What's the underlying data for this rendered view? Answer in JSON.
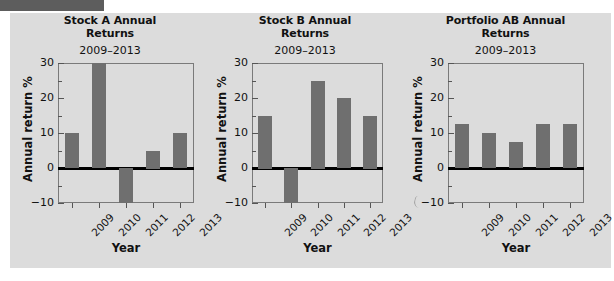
{
  "header": {
    "strip_color": "#5d5d5d"
  },
  "panel": {
    "background": "#dcdcdc",
    "bar_color": "#6f6f6f",
    "axis_color": "#7a7a7a"
  },
  "common": {
    "subtitle": "2009–2013",
    "xlabel": "Year",
    "ylabel": "Annual return %",
    "ytick_labels": [
      "30",
      "20",
      "10",
      "0",
      "−10"
    ],
    "ytick_values": [
      30,
      20,
      10,
      0,
      -10
    ],
    "categories": [
      "2009",
      "2010",
      "2011",
      "2012",
      "2013"
    ]
  },
  "charts": [
    {
      "title_line1": "Stock A Annual",
      "title_line2": "Returns"
    },
    {
      "title_line1": "Stock B Annual",
      "title_line2": "Returns"
    },
    {
      "title_line1": "Portfolio AB Annual",
      "title_line2": "Returns"
    }
  ],
  "chart_data": [
    {
      "type": "bar",
      "title": "Stock A Annual Returns",
      "subtitle": "2009–2013",
      "xlabel": "Year",
      "ylabel": "Annual return %",
      "categories": [
        "2009",
        "2010",
        "2011",
        "2012",
        "2013"
      ],
      "values": [
        10,
        30,
        -10,
        5,
        10
      ],
      "ylim": [
        -10,
        30
      ],
      "ytick_labels": [
        "30",
        "20",
        "10",
        "0",
        "−10"
      ],
      "grid": false,
      "legend": "none"
    },
    {
      "type": "bar",
      "title": "Stock B Annual Returns",
      "subtitle": "2009–2013",
      "xlabel": "Year",
      "ylabel": "Annual return %",
      "categories": [
        "2009",
        "2010",
        "2011",
        "2012",
        "2013"
      ],
      "values": [
        15,
        -10,
        25,
        20,
        15
      ],
      "ylim": [
        -10,
        30
      ],
      "ytick_labels": [
        "30",
        "20",
        "10",
        "0",
        "−10"
      ],
      "grid": false,
      "legend": "none"
    },
    {
      "type": "bar",
      "title": "Portfolio AB Annual Returns",
      "subtitle": "2009–2013",
      "xlabel": "Year",
      "ylabel": "Annual return %",
      "categories": [
        "2009",
        "2010",
        "2011",
        "2012",
        "2013"
      ],
      "values": [
        12.5,
        10,
        7.5,
        12.5,
        12.5
      ],
      "ylim": [
        -10,
        30
      ],
      "ytick_labels": [
        "30",
        "20",
        "10",
        "0",
        "−10"
      ],
      "grid": false,
      "legend": "none"
    }
  ]
}
